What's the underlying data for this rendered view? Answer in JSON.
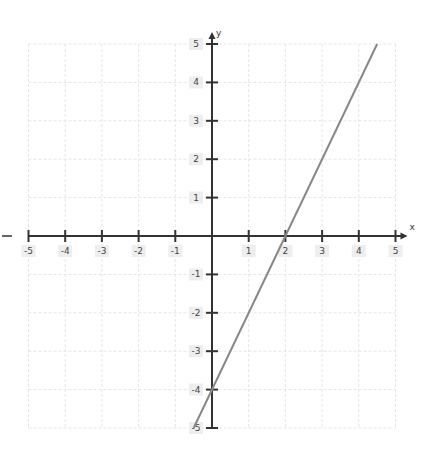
{
  "chart_data": {
    "type": "line",
    "title": "",
    "xlabel": "x",
    "ylabel": "y",
    "xlim": [
      -5,
      5
    ],
    "ylim": [
      -5,
      5
    ],
    "grid": true,
    "x_ticks": [
      -5,
      -4,
      -3,
      -2,
      -1,
      1,
      2,
      3,
      4,
      5
    ],
    "y_ticks": [
      5,
      4,
      3,
      2,
      1,
      -1,
      -2,
      -3,
      -4,
      -5
    ],
    "series": [
      {
        "name": "y = 2x - 4",
        "equation": "y = 2x - 4",
        "x": [
          -0.5,
          4.5
        ],
        "y": [
          -5,
          5
        ],
        "color": "#888888"
      }
    ],
    "annotations": [
      "x-intercept at 2",
      "y-intercept at -4"
    ]
  },
  "axes": {
    "x_name": "x",
    "y_name": "y"
  },
  "colors": {
    "axis": "#333333",
    "grid": "#e6e6e6",
    "line": "#888888"
  }
}
